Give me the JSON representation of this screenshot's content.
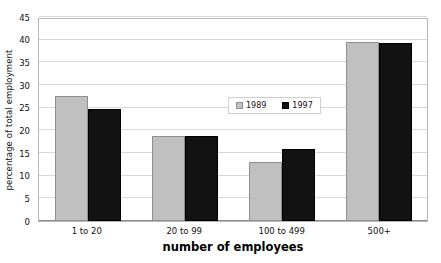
{
  "chart_data": {
    "type": "bar",
    "title": "",
    "xlabel": "number of employees",
    "ylabel": "percentage of total employment",
    "categories": [
      "1 to 20",
      "20 to 99",
      "100 to 499",
      "500+"
    ],
    "series": [
      {
        "name": "1989",
        "color": "#c0c0c0",
        "values": [
          27.6,
          18.8,
          13.0,
          39.4
        ]
      },
      {
        "name": "1997",
        "color": "#121212",
        "values": [
          24.7,
          18.7,
          15.9,
          39.3
        ]
      }
    ],
    "ylim": [
      0,
      45
    ],
    "ytick_labels": [
      "0",
      "5",
      "10",
      "15",
      "20",
      "25",
      "30",
      "35",
      "40",
      "45"
    ],
    "ytick_values": [
      0,
      5,
      10,
      15,
      20,
      25,
      30,
      35,
      40,
      45
    ],
    "grid": true,
    "legend_position": "center-upper-inside",
    "legend_entries": [
      "1989",
      "1997"
    ]
  }
}
